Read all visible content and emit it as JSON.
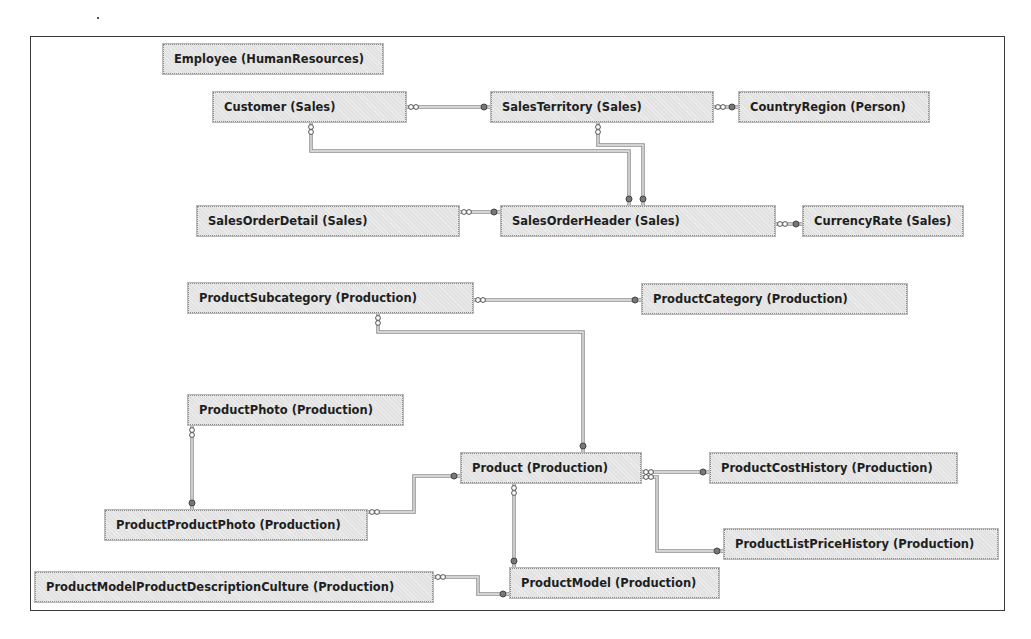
{
  "diagram": {
    "type": "database-relationship-diagram",
    "entities": [
      {
        "id": "employee",
        "label": "Employee (HumanResources)",
        "x": 163,
        "y": 44,
        "w": 220
      },
      {
        "id": "customer",
        "label": "Customer (Sales)",
        "x": 213,
        "y": 92,
        "w": 193
      },
      {
        "id": "salesterritory",
        "label": "SalesTerritory (Sales)",
        "x": 491,
        "y": 92,
        "w": 222
      },
      {
        "id": "countryregion",
        "label": "CountryRegion (Person)",
        "x": 739,
        "y": 92,
        "w": 190
      },
      {
        "id": "salesorderdetail",
        "label": "SalesOrderDetail (Sales)",
        "x": 197,
        "y": 206,
        "w": 262
      },
      {
        "id": "salesorderheader",
        "label": "SalesOrderHeader (Sales)",
        "x": 501,
        "y": 206,
        "w": 274
      },
      {
        "id": "currencyrate",
        "label": "CurrencyRate (Sales)",
        "x": 803,
        "y": 206,
        "w": 160
      },
      {
        "id": "productsubcategory",
        "label": "ProductSubcategory (Production)",
        "x": 188,
        "y": 283,
        "w": 285
      },
      {
        "id": "productcategory",
        "label": "ProductCategory (Production)",
        "x": 642,
        "y": 284,
        "w": 265
      },
      {
        "id": "productphoto",
        "label": "ProductPhoto (Production)",
        "x": 188,
        "y": 395,
        "w": 215
      },
      {
        "id": "product",
        "label": "Product (Production)",
        "x": 461,
        "y": 453,
        "w": 180
      },
      {
        "id": "productcosthistory",
        "label": "ProductCostHistory (Production)",
        "x": 710,
        "y": 453,
        "w": 247
      },
      {
        "id": "productproductphoto",
        "label": "ProductProductPhoto (Production)",
        "x": 105,
        "y": 510,
        "w": 262
      },
      {
        "id": "productlistpricehistory",
        "label": "ProductListPriceHistory (Production)",
        "x": 724,
        "y": 529,
        "w": 274
      },
      {
        "id": "productmodelproductdescriptionculture",
        "label": "ProductModelProductDescriptionCulture (Production)",
        "x": 35,
        "y": 572,
        "w": 398
      },
      {
        "id": "productmodel",
        "label": "ProductModel (Production)",
        "x": 510,
        "y": 568,
        "w": 209
      }
    ],
    "relationships": [
      {
        "from": "customer",
        "to": "salesterritory",
        "points": "406,107 491,107"
      },
      {
        "from": "salesterritory",
        "to": "countryregion",
        "points": "713,107 739,107"
      },
      {
        "from": "customer",
        "to": "salesorderheader",
        "points": "311,122 311,151 629,151 629,206"
      },
      {
        "from": "salesterritory",
        "to": "salesorderheader",
        "points": "598,122 598,145 643,145 643,206"
      },
      {
        "from": "salesorderdetail",
        "to": "salesorderheader",
        "points": "459,212 501,212"
      },
      {
        "from": "salesorderheader",
        "to": "currencyrate",
        "points": "775,224 803,224"
      },
      {
        "from": "productsubcategory",
        "to": "productcategory",
        "points": "473,300 642,300"
      },
      {
        "from": "productsubcategory",
        "to": "product",
        "points": "378,313 378,332 583,332 583,453"
      },
      {
        "from": "productphoto",
        "to": "productproductphoto",
        "points": "192,425 192,510"
      },
      {
        "from": "productproductphoto",
        "to": "product",
        "points": "367,512 414,512 414,476 461,476"
      },
      {
        "from": "product",
        "to": "productcosthistory",
        "points": "641,472 710,472"
      },
      {
        "from": "product",
        "to": "productlistpricehistory",
        "points": "641,477 657,477 657,551 724,551"
      },
      {
        "from": "product",
        "to": "productmodel",
        "points": "514,483 514,568"
      },
      {
        "from": "productmodelproductdescriptionculture",
        "to": "productmodel",
        "points": "433,577 478,577 478,594 510,594"
      }
    ]
  }
}
